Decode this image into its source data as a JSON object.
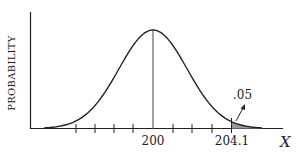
{
  "chart_data": {
    "type": "line",
    "title": "",
    "xlabel": "X",
    "ylabel": "PROBABILITY",
    "mean": 200,
    "critical_value": 204.1,
    "tail_area": 0.05,
    "tail_area_label": ".05",
    "tick_labels": [
      "200",
      "204.1"
    ],
    "minor_ticks_left_of_mean": 4,
    "minor_ticks_right_of_mean": 3,
    "mean_line": true,
    "shaded_region": "right tail beyond 204.1",
    "grid": false,
    "legend": null
  },
  "colors": {
    "line": "#222222",
    "shade": "#999999"
  }
}
